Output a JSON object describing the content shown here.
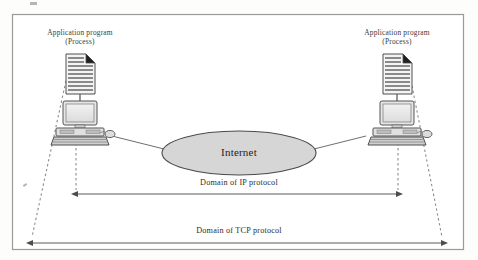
{
  "figure": {
    "type": "network-protocol-domain-diagram",
    "frame": {
      "x": 12,
      "y": 14,
      "w": 452,
      "h": 236,
      "border_color": "#9a9a9a",
      "fill": "#ffffff"
    },
    "background": "#fdfdfb"
  },
  "nodes": {
    "left": {
      "label_line1": "Application program",
      "label_line2": "(Process)",
      "document_icon": "document-page-icon",
      "computer_icon": "desktop-computer-icon"
    },
    "right": {
      "label_line1": "Application program",
      "label_line2": "(Process)",
      "document_icon": "document-page-icon",
      "computer_icon": "desktop-computer-icon"
    }
  },
  "cloud": {
    "label": "Internet",
    "shape": "ellipse",
    "fill": "#d6d6d6",
    "stroke": "#4a4a4a",
    "cx": 239,
    "cy": 153,
    "rx": 77,
    "ry": 22
  },
  "spans": [
    {
      "name": "ip-domain",
      "label": "Domain of IP protocol",
      "y": 194,
      "x_start": 76,
      "x_end": 398,
      "arrowheads": "both",
      "color": "#5a5a5a"
    },
    {
      "name": "tcp-domain",
      "label": "Domain of TCP protocol",
      "y": 243,
      "x_start": 31,
      "x_end": 443,
      "arrowheads": "both",
      "color": "#5a5a5a"
    }
  ],
  "connectors": {
    "link_style": "solid",
    "link_color": "#6e6e6e",
    "dashed_style": "dashed",
    "dashed_color": "#8a8a8a",
    "left_link": {
      "x1": 112,
      "y1": 136,
      "x2": 166,
      "y2": 150
    },
    "right_link": {
      "x1": 312,
      "y1": 150,
      "x2": 366,
      "y2": 136
    },
    "left_tcp_guide": {
      "x1": 66,
      "y1": 78,
      "x2": 31,
      "y2": 239
    },
    "right_tcp_guide": {
      "x1": 411,
      "y1": 78,
      "x2": 443,
      "y2": 239
    },
    "left_ip_guide": {
      "x1": 76,
      "y1": 131,
      "x2": 76,
      "y2": 190
    },
    "right_ip_guide": {
      "x1": 398,
      "y1": 131,
      "x2": 398,
      "y2": 190
    }
  },
  "colors": {
    "paper": "#fdfdfb",
    "frame_border": "#9a9a9a",
    "ink": "#2b2b2b",
    "cloud_fill": "#d6d6d6",
    "device_fill": "#e3e3e3",
    "device_stroke": "#585858"
  }
}
